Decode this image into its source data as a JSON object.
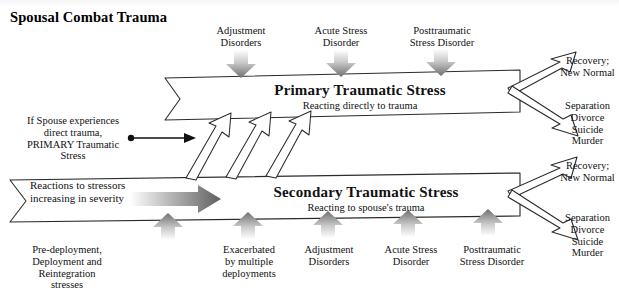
{
  "title": "Spousal Combat Trauma",
  "banners": {
    "primary": {
      "title": "Primary Traumatic Stress",
      "subtitle": "Reacting directly to trauma"
    },
    "secondary": {
      "title": "Secondary Traumatic Stress",
      "subtitle": "Reacting to spouse's trauma"
    }
  },
  "top_stressors": [
    {
      "label": "Adjustment\nDisorders"
    },
    {
      "label": "Acute Stress\nDisorder"
    },
    {
      "label": "Posttraumatic\nStress Disorder"
    }
  ],
  "bottom_stressors": [
    {
      "label": "Pre-deployment,\nDeployment and\nReintegration\nstresses"
    },
    {
      "label": "Exacerbated\nby multiple\ndeployments"
    },
    {
      "label": "Adjustment\nDisorders"
    },
    {
      "label": "Acute Stress\nDisorder"
    },
    {
      "label": "Posttraumatic\nStress Disorder"
    }
  ],
  "outcomes": {
    "primary_positive": "Recovery;\nNew Normal",
    "primary_negative": "Separation\nDivorce\nSuicide\nMurder",
    "secondary_positive": "Recovery;\nNew Normal",
    "secondary_negative": "Separation\nDivorce\nSuicide\nMurder"
  },
  "notes": {
    "spouse_direct_trauma": "If Spouse experiences\ndirect trauma,\nPRIMARY Traumatic\nStress",
    "severity_flow": "Reactions to stressors\nincreasing in severity"
  },
  "colors": {
    "ink": "#000000",
    "arrow_dark": "#6b6b6b",
    "arrow_light": "#ffffff",
    "banner_fill": "#ffffff"
  }
}
